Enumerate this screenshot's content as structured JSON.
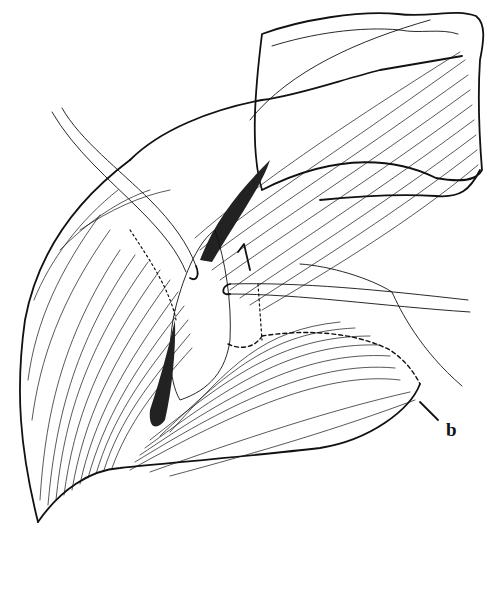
{
  "figure": {
    "label": "b",
    "style": "black-and-white anatomical line illustration",
    "colors": {
      "ink": "#111111",
      "background": "#ffffff"
    }
  },
  "elements": {
    "retractors": [
      {
        "id": "retractor-left",
        "direction": "upper-left to center, hooked tip"
      },
      {
        "id": "retractor-right",
        "direction": "right edge to center, hooked tip"
      }
    ],
    "leader_line": {
      "target_label": "b"
    }
  }
}
